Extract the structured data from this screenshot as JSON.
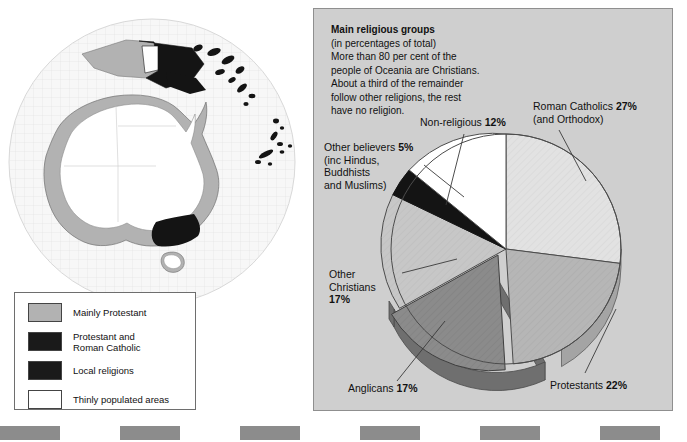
{
  "caption": {
    "title": "Main religious groups",
    "lines": [
      "(in percentages of total)",
      "More than 80 per cent of the",
      "people of Oceania are Christians.",
      "About a third of the remainder",
      "follow other religions, the rest",
      "have no religion."
    ]
  },
  "map": {
    "name": "oceania-globe-map",
    "legend": [
      {
        "label": "Mainly Protestant",
        "color": "#b2b2b2"
      },
      {
        "label": "Protestant and\nRoman Catholic",
        "color": "#1a1a1a"
      },
      {
        "label": "Local religions",
        "color": "#1a1a1a"
      },
      {
        "label": "Thinly populated areas",
        "color": "#ffffff"
      }
    ]
  },
  "labels": {
    "non_religious": "Non-religious ",
    "non_religious_pct": "12%",
    "roman_catholics": "Roman Catholics ",
    "roman_catholics_pct": "27%",
    "roman_catholics_sub": "(and Orthodox)",
    "other_believers": "Other believers ",
    "other_believers_pct": "5%",
    "other_believers_sub": "(inc Hindus,\nBuddhists\nand Muslims)",
    "other_christians": "Other\nChristians",
    "other_christians_pct": "17%",
    "anglicans": "Anglicans ",
    "anglicans_pct": "17%",
    "protestants": "Protestants ",
    "protestants_pct": "22%"
  },
  "chart_data": {
    "type": "pie",
    "title": "Main religious groups",
    "subtitle": "(in percentages of total)",
    "unit": "percent",
    "start_angle_deg": 0,
    "direction": "clockwise",
    "categories": [
      "Roman Catholics (and Orthodox)",
      "Protestants",
      "Anglicans",
      "Other Christians",
      "Other believers (inc Hindus, Buddhists and Muslims)",
      "Non-religious"
    ],
    "values": [
      27,
      22,
      17,
      17,
      5,
      12
    ],
    "colors": [
      "#e2e2e2",
      "#b6b6b6",
      "#8b8b8b",
      "#c7c7c7",
      "#141414",
      "#ffffff"
    ],
    "exploded": [
      "Anglicans"
    ],
    "legend": "labels-with-leader-lines",
    "total": 100
  },
  "bottom_bar": {
    "name": "film-edge-strip",
    "segment_color": "#8c8c8c",
    "gap_color": "#ffffff",
    "segment_width": 60,
    "segment_count": 12
  },
  "colors": {
    "panel_bg": "#cfcfcf",
    "panel_border": "#8f8f8f",
    "map_land_protestant": "#b2b2b2",
    "map_land_black": "#141414",
    "map_land_white": "#ffffff",
    "globe_bg": "#f4f4f4"
  }
}
